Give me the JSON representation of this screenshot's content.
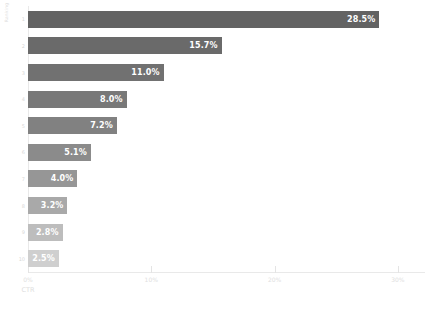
{
  "chart_data": {
    "type": "bar",
    "orientation": "horizontal",
    "title": "",
    "subtitle": "",
    "xlabel": "CTR",
    "ylabel": "Ranking",
    "categories": [
      "1",
      "2",
      "3",
      "4",
      "5",
      "6",
      "7",
      "8",
      "9",
      "10"
    ],
    "values": [
      28.5,
      15.7,
      11.0,
      8.0,
      7.2,
      5.1,
      4.0,
      3.2,
      2.8,
      2.5
    ],
    "value_labels": [
      "28.5%",
      "15.7%",
      "11.0%",
      "8.0%",
      "7.2%",
      "5.1%",
      "4.0%",
      "3.2%",
      "2.8%",
      "2.5%"
    ],
    "bar_colors": [
      "#636363",
      "#6a6a6a",
      "#717171",
      "#787878",
      "#818181",
      "#8b8b8b",
      "#969696",
      "#a9a9a9",
      "#bdbdbd",
      "#cfcfcf"
    ],
    "xlim": [
      0,
      32.2
    ],
    "xticks": [
      0,
      10,
      20,
      30
    ],
    "xtick_labels": [
      "0%",
      "10%",
      "20%",
      "30%"
    ],
    "ytick_labels": [
      "1",
      "2",
      "3",
      "4",
      "5",
      "6",
      "7",
      "8",
      "9",
      "10"
    ],
    "grid": false,
    "legend": false,
    "value_label_position": "inside-end",
    "value_label_color": "#ffffff",
    "axis_color": "#e9e9e9",
    "tick_label_color": "#e0e0e0",
    "background": "#ffffff"
  }
}
